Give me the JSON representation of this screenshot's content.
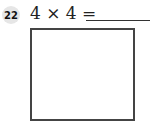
{
  "question": {
    "number": "22",
    "expression": "4 × 4 =",
    "answer": ""
  }
}
